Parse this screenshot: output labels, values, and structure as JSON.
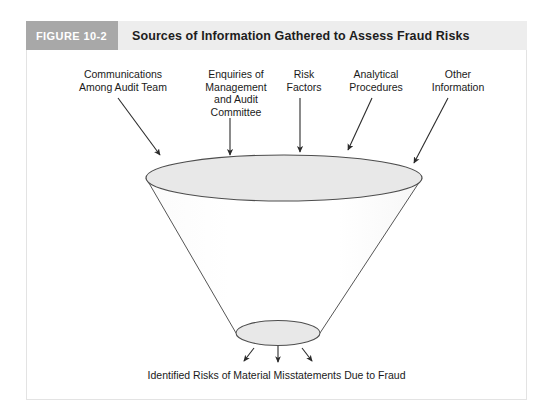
{
  "figure": {
    "tag": "FIGURE 10-2",
    "title": "Sources of Information Gathered to Assess Fraud Risks"
  },
  "sources": [
    {
      "id": "communications-among-audit-team",
      "label": "Communications\nAmong Audit Team"
    },
    {
      "id": "enquiries-of-management-and-audit-committee",
      "label": "Enquiries of\nManagement\nand Audit\nCommittee"
    },
    {
      "id": "risk-factors",
      "label": "Risk\nFactors"
    },
    {
      "id": "analytical-procedures",
      "label": "Analytical\nProcedures"
    },
    {
      "id": "other-information",
      "label": "Other\nInformation"
    }
  ],
  "outcome": {
    "caption": "Identified Risks of Material Misstatements Due to Fraud"
  },
  "colors": {
    "tag_background": "#a8a8a8",
    "header_background": "#ededed",
    "panel_background": "#ffffff",
    "panel_border": "#e3e3e3",
    "funnel_fill": "#e8e8e8",
    "funnel_stroke": "#555555",
    "arrow_color": "#2b2b2b",
    "text_color": "#1a1a1a"
  }
}
